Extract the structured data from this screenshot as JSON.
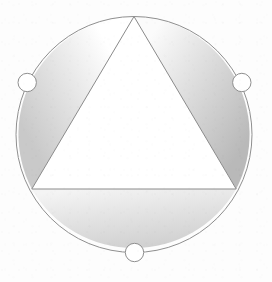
{
  "figure": {
    "background_color": "#fdfdfd",
    "stroke_color": "#8c8c8c",
    "canvas": {
      "width": 272,
      "height": 282
    }
  },
  "circle": {
    "name": "outer-circle",
    "cx": 134,
    "cy": 134.5,
    "r": 118,
    "stroke": "#8f8f8f",
    "stroke_width": 1,
    "fill": "none"
  },
  "triangle": {
    "name": "inscribed-triangle",
    "points": "134,16.5 31.8,189 236.2,189",
    "vertices": [
      {
        "label": "apex-top",
        "x": 134,
        "y": 16.5
      },
      {
        "label": "vertex-bottom-left",
        "x": 31.8,
        "y": 189
      },
      {
        "label": "vertex-bottom-right",
        "x": 236.2,
        "y": 189
      }
    ],
    "stroke": "#8a8a8a",
    "stroke_width": 1,
    "fill": "#ffffff"
  },
  "segments": [
    {
      "name": "segment-left",
      "path": "M 134,16.5 A 118,118 0 0 0 31.8,189 Z",
      "gradient_id": "grad-left",
      "gradient_from": "#ffffff",
      "gradient_to": "#c9c9c9",
      "gradient_x1": "78%",
      "gradient_y1": "18%",
      "gradient_x2": "10%",
      "gradient_y2": "72%"
    },
    {
      "name": "segment-right",
      "path": "M 134,16.5 A 118,118 0 0 1 236.2,189 Z",
      "gradient_id": "grad-right",
      "gradient_from": "#fbfbfb",
      "gradient_to": "#b9b9b9",
      "gradient_x1": "18%",
      "gradient_y1": "8%",
      "gradient_x2": "92%",
      "gradient_y2": "78%"
    },
    {
      "name": "segment-bottom",
      "path": "M 31.8,189 A 118,118 0 0 0 236.2,189 Z",
      "gradient_id": "grad-bottom",
      "gradient_from": "#f4f4f4",
      "gradient_to": "#cfcfcf",
      "gradient_x1": "22%",
      "gradient_y1": "0%",
      "gradient_x2": "62%",
      "gradient_y2": "100%"
    }
  ],
  "markers": [
    {
      "name": "arc-marker-left",
      "cx": 27.2,
      "cy": 82.5,
      "r": 9.2,
      "fill": "#ffffff",
      "stroke": "#8f8f8f",
      "stroke_width": 1
    },
    {
      "name": "arc-marker-right",
      "cx": 241.8,
      "cy": 82.5,
      "r": 9.2,
      "fill": "#ffffff",
      "stroke": "#8f8f8f",
      "stroke_width": 1
    },
    {
      "name": "arc-marker-bottom",
      "cx": 134.5,
      "cy": 252.5,
      "r": 9.2,
      "fill": "#ffffff",
      "stroke": "#8f8f8f",
      "stroke_width": 1
    }
  ]
}
